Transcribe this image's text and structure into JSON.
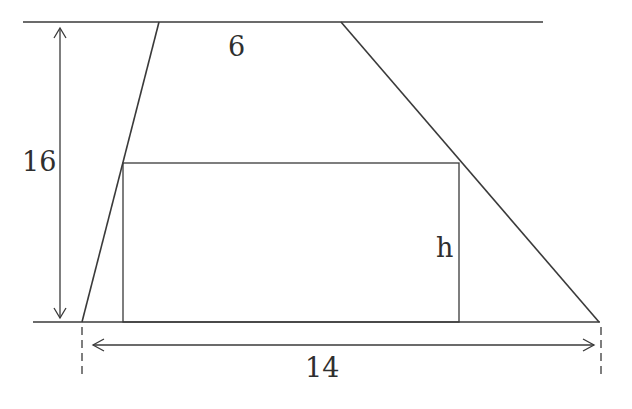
{
  "diagram": {
    "type": "trapezoid-with-inscribed-rectangle",
    "labels": {
      "top_base": "6",
      "height": "16",
      "bottom_base": "14",
      "rectangle_height": "h"
    },
    "values": {
      "top_base": 6,
      "bottom_base": 14,
      "trapezoid_height": 16
    },
    "line_color": "#3a3a3a"
  }
}
